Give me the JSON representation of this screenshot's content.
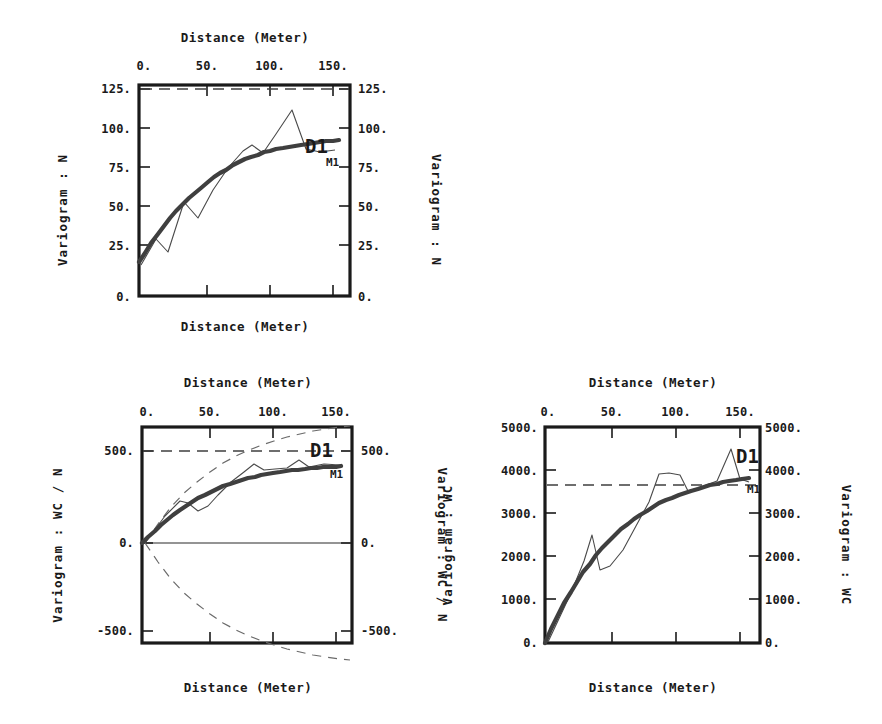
{
  "figure": {
    "background": "#ffffff",
    "ink_color": "#1a1a1a",
    "model_color": "#3f3f3f",
    "experimental_color": "#4a4a4a",
    "sill_color": "#3f3f3f",
    "hull_color": "#6a6a6a"
  },
  "charts": [
    {
      "id": "variogram-n",
      "type": "line",
      "title_top": "Distance  (Meter)",
      "title_bottom": "Distance  (Meter)",
      "ylabel_left": "Variogram : N",
      "ylabel_right": "Variogram : N",
      "xlabel": "Distance  (Meter)",
      "ylabel": "Variogram : N",
      "xticks": [
        0,
        50,
        100,
        150
      ],
      "xticklabels": [
        "0.",
        "50.",
        "100.",
        "150."
      ],
      "yticks": [
        0,
        25,
        50,
        75,
        100,
        125
      ],
      "yticklabels": [
        "0.",
        "25.",
        "50.",
        "75.",
        "100.",
        "125."
      ],
      "xlim": [
        -5,
        168
      ],
      "ylim": [
        0,
        136
      ],
      "sill": 130,
      "legend": [
        {
          "key": "D1",
          "label": "D1",
          "meaning": "experimental-variogram"
        },
        {
          "key": "M1",
          "label": "M1",
          "meaning": "fitted-model"
        }
      ],
      "series": [
        {
          "name": "M1",
          "kind": "model",
          "x": [
            0,
            5,
            10,
            15,
            20,
            25,
            30,
            35,
            40,
            45,
            50,
            55,
            60,
            65,
            70,
            75,
            80,
            85,
            90,
            95,
            100,
            105,
            110,
            115,
            120,
            125,
            130,
            135,
            140,
            145,
            150,
            155,
            160
          ],
          "y": [
            22,
            28,
            34,
            40,
            45,
            50,
            55,
            59,
            63,
            67,
            70,
            74,
            77,
            80,
            82,
            85,
            87,
            89,
            90.5,
            92,
            93.5,
            94.5,
            95.5,
            96.3,
            97,
            97.6,
            98.1,
            98.6,
            99,
            99.4,
            99.7,
            100,
            100.2
          ]
        },
        {
          "name": "D1",
          "kind": "experimental",
          "x": [
            2,
            14,
            24,
            37,
            48,
            60,
            72,
            84,
            91,
            100,
            110,
            123,
            134,
            145,
            157
          ],
          "y": [
            20,
            37,
            29,
            61,
            50,
            68,
            82,
            93,
            97,
            92,
            104,
            120,
            95,
            93,
            94
          ]
        }
      ]
    },
    {
      "id": "cross-variogram-wc-n",
      "type": "line",
      "title_top": "Distance  (Meter)",
      "title_bottom": "Distance  (Meter)",
      "ylabel_left": "Variogram : WC / N",
      "ylabel_right": "Variogram : WC / N",
      "xlabel": "Distance  (Meter)",
      "ylabel": "Variogram : WC / N",
      "xticks": [
        0,
        50,
        100,
        150
      ],
      "xticklabels": [
        "0.",
        "50.",
        "100.",
        "150."
      ],
      "yticks": [
        -500,
        0,
        500
      ],
      "yticklabels": [
        "-500.",
        "0.",
        "500."
      ],
      "xlim": [
        -5,
        168
      ],
      "ylim": [
        -640,
        700
      ],
      "sill": 500,
      "legend": [
        {
          "key": "D1",
          "label": "D1",
          "meaning": "experimental-cross-variogram"
        },
        {
          "key": "M1",
          "label": "M1",
          "meaning": "fitted-model"
        }
      ],
      "series": [
        {
          "name": "M1",
          "kind": "model",
          "x": [
            0,
            5,
            10,
            15,
            20,
            25,
            30,
            35,
            40,
            45,
            50,
            55,
            60,
            65,
            70,
            75,
            80,
            85,
            90,
            95,
            100,
            105,
            110,
            115,
            120,
            125,
            130,
            135,
            140,
            145,
            150,
            155,
            160
          ],
          "y": [
            0,
            35,
            68,
            99,
            128,
            155,
            180,
            203,
            224,
            244,
            262,
            279,
            294,
            308,
            320,
            332,
            342,
            351,
            360,
            367,
            374,
            380,
            385,
            390,
            394,
            398,
            402,
            405,
            408,
            411,
            414,
            416,
            418
          ]
        },
        {
          "name": "D1",
          "kind": "experimental",
          "x": [
            2,
            18,
            30,
            36,
            44,
            52,
            60,
            70,
            80,
            88,
            96,
            105,
            114,
            124,
            132,
            144,
            157
          ],
          "y": [
            0,
            150,
            230,
            218,
            175,
            205,
            260,
            330,
            385,
            430,
            395,
            400,
            405,
            450,
            412,
            430,
            420
          ]
        },
        {
          "name": "hull-upper",
          "kind": "hull",
          "x": [
            0,
            10,
            20,
            30,
            40,
            50,
            60,
            70,
            80,
            90,
            100,
            110,
            120,
            130,
            140,
            150,
            160
          ],
          "y": [
            0,
            105,
            195,
            272,
            336,
            390,
            436,
            474,
            506,
            534,
            557,
            577,
            594,
            608,
            620,
            630,
            639
          ]
        },
        {
          "name": "hull-lower",
          "kind": "hull",
          "x": [
            0,
            10,
            20,
            30,
            40,
            50,
            60,
            70,
            80,
            90,
            100,
            110,
            120,
            130,
            140,
            150,
            160
          ],
          "y": [
            0,
            -105,
            -195,
            -272,
            -336,
            -390,
            -436,
            -474,
            -506,
            -534,
            -557,
            -577,
            -594,
            -608,
            -620,
            -630,
            -639
          ]
        }
      ]
    },
    {
      "id": "variogram-wc",
      "type": "line",
      "title_top": "Distance  (Meter)",
      "title_bottom": "Distance  (Meter)",
      "ylabel_left": "Variogram : WC",
      "ylabel_right": "Variogram : WC",
      "xlabel": "Distance  (Meter)",
      "ylabel": "Variogram : WC",
      "xticks": [
        0,
        50,
        100,
        150
      ],
      "xticklabels": [
        "0.",
        "50.",
        "100.",
        "150."
      ],
      "yticks": [
        0,
        1000,
        2000,
        3000,
        4000,
        5000
      ],
      "yticklabels": [
        "0.",
        "1000.",
        "2000.",
        "3000.",
        "4000.",
        "5000."
      ],
      "xlim": [
        -5,
        168
      ],
      "ylim": [
        0,
        5000
      ],
      "sill": 3650,
      "legend": [
        {
          "key": "D1",
          "label": "D1",
          "meaning": "experimental-variogram"
        },
        {
          "key": "M1",
          "label": "M1",
          "meaning": "fitted-model"
        }
      ],
      "series": [
        {
          "name": "M1",
          "kind": "model",
          "x": [
            0,
            5,
            10,
            15,
            20,
            25,
            30,
            35,
            40,
            45,
            50,
            55,
            60,
            65,
            70,
            75,
            80,
            85,
            90,
            95,
            100,
            105,
            110,
            115,
            120,
            125,
            130,
            135,
            140,
            145,
            150,
            155,
            160
          ],
          "y": [
            0,
            330,
            640,
            920,
            1180,
            1420,
            1640,
            1840,
            2030,
            2200,
            2360,
            2500,
            2640,
            2760,
            2870,
            2975,
            3070,
            3155,
            3235,
            3305,
            3370,
            3430,
            3485,
            3535,
            3580,
            3622,
            3660,
            3695,
            3727,
            3756,
            3782,
            3806,
            3828
          ]
        },
        {
          "name": "D1",
          "kind": "experimental",
          "x": [
            2,
            20,
            30,
            36,
            42,
            50,
            60,
            70,
            80,
            88,
            96,
            104,
            110,
            120,
            132,
            143,
            150,
            157
          ],
          "y": [
            30,
            1150,
            1900,
            2500,
            1680,
            1760,
            2150,
            2700,
            3250,
            3900,
            3930,
            3880,
            3530,
            3600,
            3740,
            4480,
            3780,
            3720
          ]
        }
      ]
    }
  ]
}
